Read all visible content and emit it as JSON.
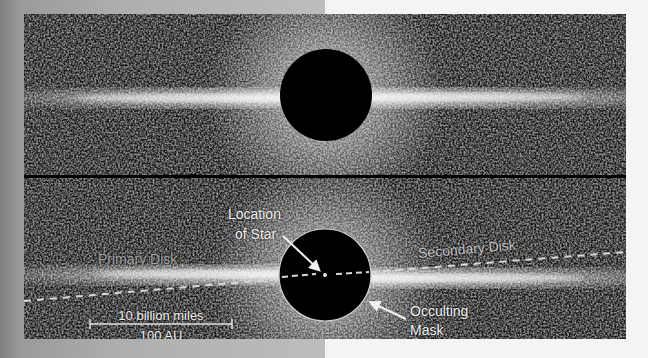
{
  "figure": {
    "background": {
      "left_color": "#a8a8a8",
      "right_color": "#f4f4f4"
    },
    "top_panel": {
      "mask": {
        "cx": 302,
        "cy": 81,
        "r": 46,
        "color": "#000000"
      }
    },
    "bottom_panel": {
      "mask": {
        "cx": 301,
        "cy": 97,
        "r": 46,
        "color": "#000000",
        "border": "#cfcfcf"
      },
      "labels": {
        "location_line1": "Location",
        "location_line2": "of Star",
        "primary_disk": "Primary Disk",
        "secondary_disk": "Secondary Disk",
        "occulting_line1": "Occulting",
        "occulting_line2": "Mask",
        "scale_top": "10 billion miles",
        "scale_bottom": "100 AU"
      }
    }
  }
}
